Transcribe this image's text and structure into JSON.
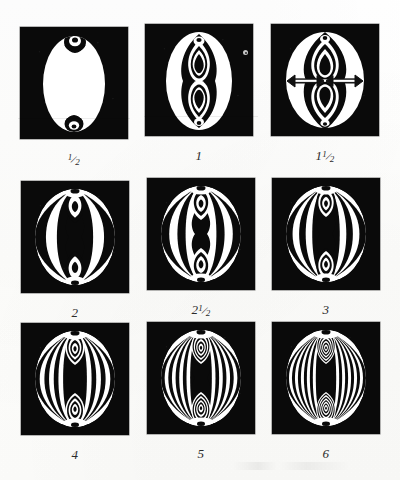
{
  "plate": {
    "title": "Interference figure plate",
    "background_color": "#fdfdfc",
    "panel_background_color": "#0a0a0a",
    "fringe_color": "#ffffff",
    "rows": 3,
    "columns": 3
  },
  "figures": [
    {
      "label": "½",
      "label_parts": {
        "whole": "",
        "numerator": "1",
        "denominator": "2"
      },
      "order": 0.5,
      "fringe_count": 0,
      "shape": "oval",
      "has_arrows": false,
      "description": "Large white oval, small dark crescent eyes at top and bottom"
    },
    {
      "label": "1",
      "label_parts": {
        "whole": "1",
        "numerator": "",
        "denominator": ""
      },
      "order": 1,
      "fringe_count": 1,
      "shape": "oval",
      "has_arrows": false,
      "description": "White oval with dark central column and two teardrop melatopes"
    },
    {
      "label": "1½",
      "label_parts": {
        "whole": "1",
        "numerator": "1",
        "denominator": "2"
      },
      "order": 1.5,
      "fringe_count": 2,
      "shape": "circle",
      "has_arrows": true,
      "arrow_count": 2,
      "arrow_direction": "horizontal-double-headed",
      "description": "Circular figure with two horizontal double-headed arrows marking the optic axes separation"
    },
    {
      "label": "2",
      "label_parts": {
        "whole": "2",
        "numerator": "",
        "denominator": ""
      },
      "order": 2,
      "fringe_count": 3,
      "shape": "circle",
      "has_arrows": false,
      "description": "Circular figure, three vertical fringe bands each side"
    },
    {
      "label": "2½",
      "label_parts": {
        "whole": "2",
        "numerator": "1",
        "denominator": "2"
      },
      "order": 2.5,
      "fringe_count": 4,
      "shape": "circle",
      "has_arrows": false,
      "description": "Circular figure with four fringe bands and narrowing isogyres"
    },
    {
      "label": "3",
      "label_parts": {
        "whole": "3",
        "numerator": "",
        "denominator": ""
      },
      "order": 3,
      "fringe_count": 5,
      "shape": "circle",
      "has_arrows": false,
      "description": "Circular figure, five fringe bands, hourglass isogyre forming"
    },
    {
      "label": "4",
      "label_parts": {
        "whole": "4",
        "numerator": "",
        "denominator": ""
      },
      "order": 4,
      "fringe_count": 7,
      "shape": "circle",
      "has_arrows": false,
      "description": "Circular figure, seven fringe bands, pronounced hourglass centre"
    },
    {
      "label": "5",
      "label_parts": {
        "whole": "5",
        "numerator": "",
        "denominator": ""
      },
      "order": 5,
      "fringe_count": 9,
      "shape": "circle",
      "has_arrows": false,
      "description": "Circular figure, nine fringe bands, dense nested lemniscates"
    },
    {
      "label": "6",
      "label_parts": {
        "whole": "6",
        "numerator": "",
        "denominator": ""
      },
      "order": 6,
      "fringe_count": 11,
      "shape": "circle",
      "has_arrows": false,
      "description": "Circular figure, eleven fringe bands, densest pattern of the plate"
    }
  ]
}
